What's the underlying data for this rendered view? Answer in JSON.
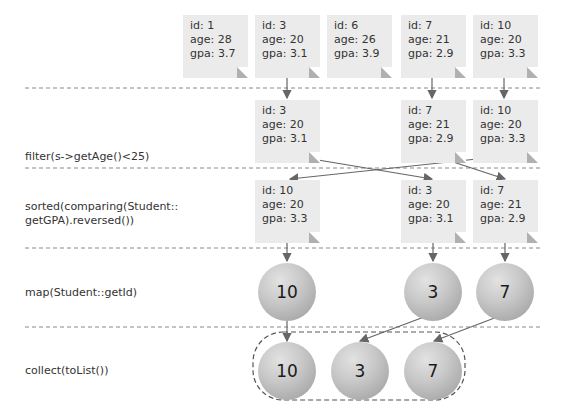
{
  "stages": [
    {
      "label": "filter(s->getAge()<25)"
    },
    {
      "label": "sorted(comparing(Student::\ngetGPA).reversed())"
    },
    {
      "label": "map(Student::getId)"
    },
    {
      "label": "collect(toList())"
    }
  ],
  "source": [
    {
      "id": "id: 1",
      "age": "age: 28",
      "gpa": "gpa: 3.7"
    },
    {
      "id": "id: 3",
      "age": "age: 20",
      "gpa": "gpa: 3.1"
    },
    {
      "id": "id: 6",
      "age": "age: 26",
      "gpa": "gpa: 3.9"
    },
    {
      "id": "id: 7",
      "age": "age: 21",
      "gpa": "gpa: 2.9"
    },
    {
      "id": "id: 10",
      "age": "age: 20",
      "gpa": "gpa: 3.3"
    }
  ],
  "filtered": [
    {
      "id": "id: 3",
      "age": "age: 20",
      "gpa": "gpa: 3.1"
    },
    {
      "id": "id: 7",
      "age": "age: 21",
      "gpa": "gpa: 2.9"
    },
    {
      "id": "id: 10",
      "age": "age: 20",
      "gpa": "gpa: 3.3"
    }
  ],
  "sorted": [
    {
      "id": "id: 10",
      "age": "age: 20",
      "gpa": "gpa: 3.3"
    },
    {
      "id": "id: 3",
      "age": "age: 20",
      "gpa": "gpa: 3.1"
    },
    {
      "id": "id: 7",
      "age": "age: 21",
      "gpa": "gpa: 2.9"
    }
  ],
  "mapped": [
    "10",
    "3",
    "7"
  ],
  "collected": [
    "10",
    "3",
    "7"
  ]
}
